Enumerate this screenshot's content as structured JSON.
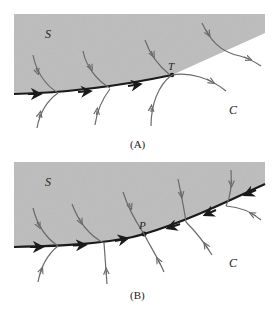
{
  "panels": [
    {
      "id": "A",
      "caption": "(A)",
      "region_label": "S",
      "outside_label": "C",
      "point_label": "T"
    },
    {
      "id": "B",
      "caption": "(B)",
      "region_label": "S",
      "outside_label": "C",
      "point_label": "P"
    }
  ],
  "colors": {
    "region_fill": "#b8b8b8",
    "main_curve": "#1a1a1a",
    "trajectory": "#6a6a6a"
  }
}
